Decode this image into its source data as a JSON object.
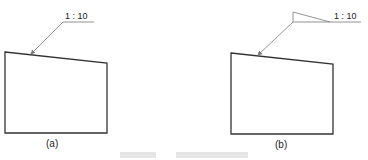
{
  "figure": {
    "panels": [
      {
        "id": "a",
        "label": "(a)",
        "scale_text": "1 : 10",
        "slope_symbol": false
      },
      {
        "id": "b",
        "label": "(b)",
        "scale_text": "1 : 10",
        "slope_symbol": true
      }
    ],
    "caption": ""
  },
  "colors": {
    "line": "#333333",
    "leader": "#777777"
  }
}
